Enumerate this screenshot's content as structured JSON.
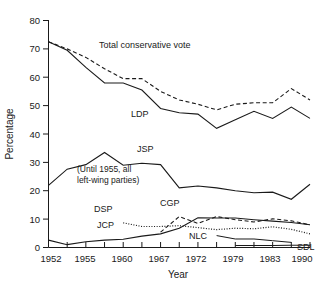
{
  "chart_data": {
    "type": "line",
    "title": "",
    "xlabel": "Year",
    "ylabel": "Percentage",
    "ylim": [
      0,
      80
    ],
    "yticks": [
      0,
      10,
      20,
      30,
      40,
      50,
      60,
      70,
      80
    ],
    "grid": false,
    "legend": "inline-labels",
    "x": [
      1952,
      1953,
      1955,
      1958,
      1960,
      1963,
      1967,
      1969,
      1972,
      1976,
      1979,
      1980,
      1983,
      1986,
      1990
    ],
    "xtick_labels": [
      "1952",
      "1955",
      "1960",
      "1967",
      "1972",
      "1979",
      "1983",
      "1990"
    ],
    "xtick_years": [
      1952,
      1955,
      1960,
      1967,
      1972,
      1979,
      1983,
      1990
    ],
    "annotations": [
      {
        "text": "(Until 1955, all",
        "target": "JSP"
      },
      {
        "text": "left-wing parties)",
        "target": "JSP"
      }
    ],
    "series": [
      {
        "name": "Total conservative vote",
        "label": "Total conservative vote",
        "style": "dashed",
        "values": [
          72.5,
          70.0,
          67.0,
          63.0,
          59.5,
          59.5,
          55.0,
          52.0,
          50.5,
          48.5,
          50.5,
          51.0,
          51.0,
          56.0,
          52.0
        ]
      },
      {
        "name": "LDP",
        "label": "LDP",
        "style": "solid",
        "values": [
          72.5,
          69.5,
          63.5,
          58.0,
          58.0,
          55.5,
          49.0,
          47.5,
          47.0,
          42.0,
          45.0,
          48.0,
          45.5,
          49.5,
          45.5
        ]
      },
      {
        "name": "JSP",
        "label": "JSP",
        "style": "solid",
        "values": [
          21.9,
          27.6,
          29.2,
          33.5,
          29.0,
          29.7,
          29.2,
          21.0,
          21.7,
          21.0,
          20.0,
          19.3,
          19.5,
          17.0,
          22.3
        ]
      },
      {
        "name": "DSP",
        "label": "DSP",
        "style": "dotted",
        "values": [
          null,
          null,
          null,
          null,
          8.7,
          7.4,
          7.4,
          7.7,
          7.0,
          6.3,
          6.8,
          6.6,
          7.3,
          6.4,
          4.8
        ]
      },
      {
        "name": "JCP",
        "label": "JCP",
        "style": "solid",
        "values": [
          2.6,
          1.0,
          2.0,
          2.6,
          2.9,
          4.0,
          4.8,
          6.8,
          10.5,
          10.4,
          10.4,
          9.8,
          9.3,
          8.8,
          8.0
        ]
      },
      {
        "name": "CGP",
        "label": "CGP",
        "style": "dashed",
        "values": [
          null,
          null,
          null,
          null,
          null,
          null,
          5.4,
          10.9,
          8.5,
          10.9,
          9.8,
          9.0,
          10.1,
          9.4,
          8.0
        ]
      },
      {
        "name": "NLC",
        "label": "NLC",
        "style": "solid-thin",
        "values": [
          null,
          null,
          null,
          null,
          null,
          null,
          null,
          null,
          null,
          4.2,
          3.0,
          3.0,
          2.4,
          1.8,
          null
        ]
      },
      {
        "name": "SDL",
        "label": "SDL",
        "style": "solid-thin",
        "values": [
          null,
          null,
          null,
          null,
          null,
          null,
          null,
          null,
          null,
          null,
          0.7,
          0.7,
          0.7,
          0.8,
          0.8
        ]
      }
    ]
  },
  "axis": {
    "y_title": "Percentage",
    "x_title": "Year",
    "y_tick_0": "0",
    "y_tick_10": "10",
    "y_tick_20": "20",
    "y_tick_30": "30",
    "y_tick_40": "40",
    "y_tick_50": "50",
    "y_tick_60": "60",
    "y_tick_70": "70",
    "y_tick_80": "80",
    "x_tick_1952": "1952",
    "x_tick_1955": "1955",
    "x_tick_1960": "1960",
    "x_tick_1967": "1967",
    "x_tick_1972": "1972",
    "x_tick_1979": "1979",
    "x_tick_1983": "1983",
    "x_tick_1990": "1990"
  },
  "labels": {
    "total_conservative": "Total conservative vote",
    "ldp": "LDP",
    "jsp": "JSP",
    "dsp": "DSP",
    "jcp": "JCP",
    "cgp": "CGP",
    "nlc": "NLC",
    "sdl": "SDL",
    "note_line1": "(Until 1955, all",
    "note_line2": "left-wing parties)"
  },
  "colors": {
    "line": "#1a1a1a",
    "background": "#ffffff"
  }
}
